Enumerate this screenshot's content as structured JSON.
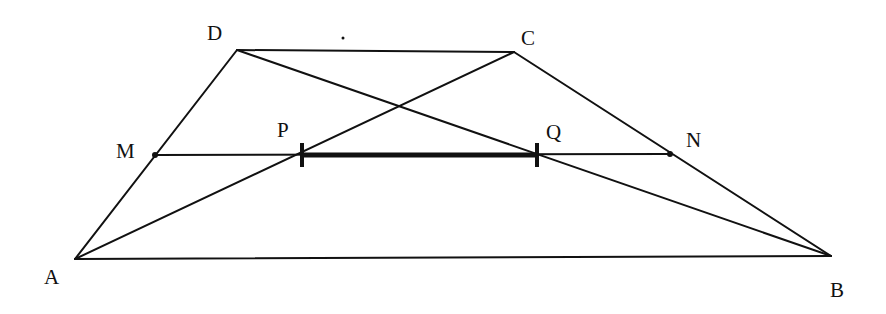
{
  "figure": {
    "colors": {
      "stroke": "#111111",
      "background": "#ffffff"
    }
  },
  "points": {
    "A": {
      "label": "A",
      "x": 75,
      "y": 259,
      "lx": 44,
      "ly": 284
    },
    "B": {
      "label": "B",
      "x": 831,
      "y": 256,
      "lx": 830,
      "ly": 297
    },
    "C": {
      "label": "C",
      "x": 514,
      "y": 52,
      "lx": 521,
      "ly": 45
    },
    "D": {
      "label": "D",
      "x": 237,
      "y": 50,
      "lx": 207,
      "ly": 40
    },
    "M": {
      "label": "M",
      "x": 155,
      "y": 155,
      "lx": 116,
      "ly": 158
    },
    "N": {
      "label": "N",
      "x": 670,
      "y": 154,
      "lx": 686,
      "ly": 147
    },
    "P": {
      "label": "P",
      "x": 302,
      "y": 155,
      "lx": 277,
      "ly": 137
    },
    "Q": {
      "label": "Q",
      "x": 537,
      "y": 155,
      "lx": 546,
      "ly": 139
    }
  },
  "segments": [
    {
      "name": "side-AB",
      "from": "A",
      "to": "B"
    },
    {
      "name": "side-BC",
      "from": "B",
      "to": "C"
    },
    {
      "name": "side-CD",
      "from": "C",
      "to": "D"
    },
    {
      "name": "side-DA",
      "from": "D",
      "to": "A"
    },
    {
      "name": "diagonal-AC",
      "from": "A",
      "to": "C"
    },
    {
      "name": "diagonal-BD",
      "from": "B",
      "to": "D"
    },
    {
      "name": "midline-MN",
      "from": "M",
      "to": "N"
    }
  ],
  "highlight": {
    "name": "segment-PQ",
    "from": "P",
    "to": "Q"
  },
  "stray_mark": {
    "x": 343,
    "y": 38
  }
}
